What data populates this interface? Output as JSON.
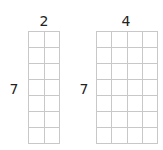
{
  "figures": [
    {
      "id": "left",
      "columns_label": "2",
      "rows_label": "7",
      "columns": 2,
      "rows": 7
    },
    {
      "id": "right",
      "columns_label": "4",
      "rows_label": "7",
      "columns": 4,
      "rows": 7
    }
  ],
  "colors": {
    "grid_line": "#c8c8c8",
    "text": "#222222",
    "background": "#ffffff"
  }
}
